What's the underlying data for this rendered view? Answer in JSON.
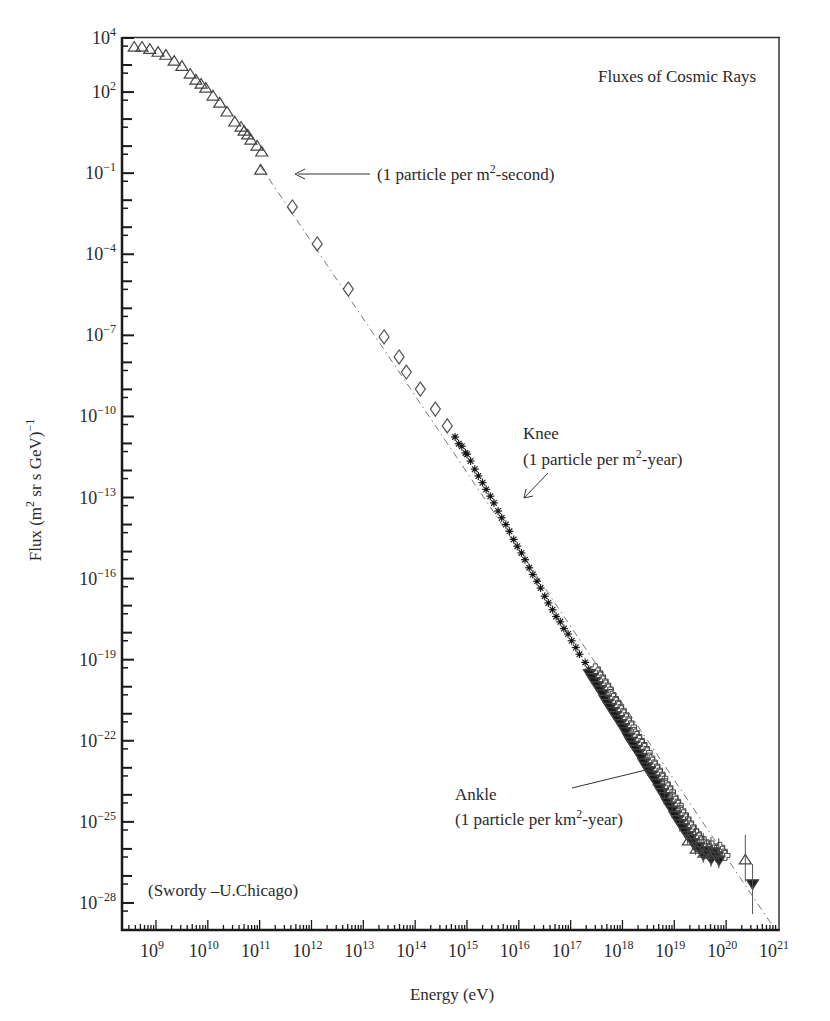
{
  "chart_data": {
    "type": "scatter",
    "title": "Fluxes of Cosmic Rays",
    "xlabel": "Energy (eV)",
    "ylabel": "Flux (m^2 sr s GeV)^-1",
    "xscale": "log",
    "yscale": "log",
    "xlim_log10": [
      8.34,
      20.95
    ],
    "ylim_log10": [
      -29,
      4
    ],
    "grid": false,
    "legend": null,
    "x_ticks": [
      {
        "exp": "9",
        "log": 9
      },
      {
        "exp": "10",
        "log": 10
      },
      {
        "exp": "11",
        "log": 11
      },
      {
        "exp": "12",
        "log": 12
      },
      {
        "exp": "13",
        "log": 13
      },
      {
        "exp": "14",
        "log": 14
      },
      {
        "exp": "15",
        "log": 15
      },
      {
        "exp": "16",
        "log": 16
      },
      {
        "exp": "17",
        "log": 17
      },
      {
        "exp": "18",
        "log": 18
      },
      {
        "exp": "19",
        "log": 19
      },
      {
        "exp": "20",
        "log": 20
      },
      {
        "exp": "21",
        "log": 21
      }
    ],
    "y_ticks": [
      {
        "exp": "4",
        "log": 4
      },
      {
        "exp": "2",
        "log": 2
      },
      {
        "exp": "−1",
        "log": -1
      },
      {
        "exp": "−4",
        "log": -4
      },
      {
        "exp": "−7",
        "log": -7
      },
      {
        "exp": "−10",
        "log": -10
      },
      {
        "exp": "−13",
        "log": -13
      },
      {
        "exp": "−16",
        "log": -16
      },
      {
        "exp": "−19",
        "log": -19
      },
      {
        "exp": "−22",
        "log": -22
      },
      {
        "exp": "−25",
        "log": -25
      },
      {
        "exp": "−28",
        "log": -28
      }
    ],
    "series": [
      {
        "name": "open triangles (low energy)",
        "marker": "triangle-open",
        "points_log10": [
          [
            8.58,
            3.67
          ],
          [
            8.73,
            3.67
          ],
          [
            8.88,
            3.59
          ],
          [
            9.04,
            3.48
          ],
          [
            9.19,
            3.37
          ],
          [
            9.35,
            3.15
          ],
          [
            9.5,
            2.96
          ],
          [
            9.66,
            2.67
          ],
          [
            9.77,
            2.45
          ],
          [
            9.87,
            2.3
          ],
          [
            9.96,
            2.15
          ],
          [
            10.1,
            1.86
          ],
          [
            10.23,
            1.6
          ],
          [
            10.37,
            1.27
          ],
          [
            10.52,
            0.9
          ],
          [
            10.64,
            0.71
          ],
          [
            10.7,
            0.56
          ],
          [
            10.77,
            0.42
          ],
          [
            10.83,
            0.23
          ],
          [
            10.95,
            0.01
          ],
          [
            11.04,
            -0.21
          ],
          [
            11.02,
            -0.88
          ]
        ]
      },
      {
        "name": "open diamonds",
        "marker": "diamond-open",
        "points_log10": [
          [
            11.63,
            -2.25
          ],
          [
            12.11,
            -3.62
          ],
          [
            12.71,
            -5.29
          ],
          [
            13.4,
            -7.06
          ],
          [
            13.69,
            -7.8
          ],
          [
            13.83,
            -8.36
          ],
          [
            14.1,
            -8.99
          ],
          [
            14.39,
            -9.73
          ],
          [
            14.62,
            -10.35
          ]
        ]
      },
      {
        "name": "asterisks",
        "marker": "asterisk",
        "points_log10": [
          [
            14.77,
            -10.76
          ],
          [
            14.9,
            -11.1
          ],
          [
            15.0,
            -11.4
          ],
          [
            15.15,
            -11.95
          ],
          [
            15.3,
            -12.45
          ],
          [
            15.45,
            -12.95
          ],
          [
            15.6,
            -13.5
          ],
          [
            15.75,
            -14.0
          ],
          [
            15.9,
            -14.55
          ],
          [
            16.05,
            -15.05
          ],
          [
            16.2,
            -15.6
          ],
          [
            16.35,
            -16.1
          ],
          [
            16.5,
            -16.65
          ],
          [
            16.65,
            -17.15
          ],
          [
            16.8,
            -17.6
          ],
          [
            16.95,
            -18.05
          ],
          [
            17.1,
            -18.55
          ],
          [
            17.28,
            -19.1
          ]
        ]
      },
      {
        "name": "mixed high-energy (filled triangles / open crosses)",
        "marker": "mixed",
        "points_log10": [
          [
            17.4,
            -19.45
          ],
          [
            17.55,
            -19.9
          ],
          [
            17.7,
            -20.4
          ],
          [
            17.85,
            -20.85
          ],
          [
            18.0,
            -21.3
          ],
          [
            18.15,
            -21.8
          ],
          [
            18.3,
            -22.25
          ],
          [
            18.45,
            -22.75
          ],
          [
            18.6,
            -23.2
          ],
          [
            18.75,
            -23.7
          ],
          [
            18.9,
            -24.2
          ],
          [
            19.05,
            -24.7
          ],
          [
            19.2,
            -25.15
          ],
          [
            19.35,
            -25.55
          ],
          [
            19.5,
            -25.85
          ],
          [
            19.65,
            -26.0
          ],
          [
            19.8,
            -26.05
          ]
        ]
      },
      {
        "name": "highest-energy open triangle",
        "marker": "triangle-open",
        "points_log10": [
          [
            20.37,
            -26.4
          ]
        ]
      },
      {
        "name": "highest-energy filled triangle",
        "marker": "triangle-filled-down",
        "points_log10": [
          [
            20.51,
            -27.3
          ]
        ]
      }
    ],
    "reference_line": {
      "style": "dash-dot",
      "from_log10": [
        11.0,
        -0.7
      ],
      "to_log10": [
        20.95,
        -29.0
      ]
    },
    "annotations": [
      {
        "text": "(1 particle per m",
        "sup": "2",
        "tail": "-second)",
        "arrow_to_log10": [
          11.33,
          -1.0
        ]
      },
      {
        "text_line1": "Knee",
        "text_line2_pre": "(1 particle per m",
        "sup": "2",
        "text_line2_post": "-year)",
        "arrow_to_log10": [
          16.0,
          -14.3
        ]
      },
      {
        "text_line1": "Ankle",
        "text_line2_pre": "(1 particle per km",
        "sup": "2",
        "text_line2_post": "-year)",
        "arrow_to_log10": [
          18.6,
          -23.3
        ]
      },
      {
        "text": "(Swordy –U.Chicago)"
      }
    ]
  },
  "labels": {
    "title": "Fluxes of Cosmic Rays",
    "xlabel": "Energy (eV)",
    "ylabel_pre": "Flux (m",
    "ylabel_sup": "2",
    "ylabel_mid": " sr s GeV)",
    "ylabel_sup2": "−1",
    "ann1_pre": "(1 particle per m",
    "ann1_sup": "2",
    "ann1_post": "-second)",
    "knee": "Knee",
    "knee_pre": "(1 particle per m",
    "knee_sup": "2",
    "knee_post": "-year)",
    "ankle": "Ankle",
    "ankle_pre": "(1 particle per km",
    "ankle_sup": "2",
    "ankle_post": "-year)",
    "credit": "(Swordy –U.Chicago)",
    "base": "10"
  }
}
